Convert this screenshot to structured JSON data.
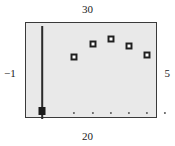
{
  "figure": {
    "labels": {
      "top": "30",
      "bottom": "20",
      "left": "−1",
      "right": "5"
    },
    "colors": {
      "plot_background": "#e9e9e9",
      "frame": "#3a3a3a",
      "marker_edge": "#1f1f1f",
      "marker_fill": "#ffffff",
      "errorbar": "#2b2b2b",
      "page_background": "#ffffff"
    }
  },
  "chart_data": {
    "type": "scatter",
    "title": "",
    "subtitle": "",
    "xlabel": "",
    "ylabel": "",
    "grid": false,
    "legend": null,
    "xlim": [
      -1,
      5
    ],
    "ylim": [
      20,
      30
    ],
    "corner_labels": {
      "top": "30",
      "bottom": "20",
      "left": "−1",
      "right": "5"
    },
    "series": [
      {
        "name": "error-bar-point",
        "style": "errorbar",
        "points": [
          {
            "x": -0.28,
            "y": 20.9,
            "yerr_low": 0.9,
            "yerr_high": 8.8,
            "marker": "filled-square",
            "px": 16,
            "py": 88,
            "bar_top_py": 3,
            "bar_bottom_py": 96
          }
        ]
      },
      {
        "name": "open-square-points",
        "style": "scatter",
        "marker": "open-square",
        "points": [
          {
            "x": 0.92,
            "y": 25.7,
            "px": 48,
            "py": 34
          },
          {
            "x": 1.78,
            "y": 27.1,
            "px": 67,
            "py": 21
          },
          {
            "x": 2.6,
            "y": 27.6,
            "px": 85,
            "py": 16
          },
          {
            "x": 3.42,
            "y": 26.9,
            "px": 103,
            "py": 23
          },
          {
            "x": 4.24,
            "y": 26.0,
            "px": 121,
            "py": 32
          }
        ]
      },
      {
        "name": "baseline-dots",
        "style": "scatter",
        "marker": "small-dot",
        "points": [
          {
            "x": 0.92,
            "y": 20.1,
            "px": 48,
            "py": 90
          },
          {
            "x": 1.78,
            "y": 20.1,
            "px": 67,
            "py": 90
          },
          {
            "x": 2.6,
            "y": 20.1,
            "px": 85,
            "py": 90
          },
          {
            "x": 3.42,
            "y": 20.1,
            "px": 103,
            "py": 90
          },
          {
            "x": 4.24,
            "y": 20.1,
            "px": 121,
            "py": 90
          },
          {
            "x": 5.0,
            "y": 20.1,
            "px": 139,
            "py": 90
          }
        ]
      }
    ]
  }
}
